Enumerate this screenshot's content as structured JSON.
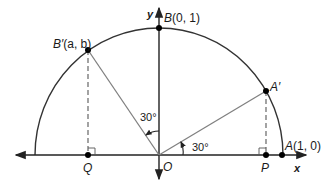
{
  "diagram": {
    "type": "unit semicircle with rotated points",
    "axes": {
      "x_label": "x",
      "y_label": "y"
    },
    "points": {
      "origin": {
        "label": "O"
      },
      "A": {
        "label": "A",
        "coords": "(1, 0)"
      },
      "A_prime": {
        "label": "A′"
      },
      "B": {
        "label": "B",
        "coords": "(0, 1)"
      },
      "B_prime": {
        "label": "B′",
        "coords": "(a, b)"
      },
      "P": {
        "label": "P"
      },
      "Q": {
        "label": "Q"
      }
    },
    "angles": {
      "angle_AOA_prime": "30°",
      "angle_BOB_prime": "30°"
    },
    "colors": {
      "stroke": "#333333",
      "radius_lines": "#808080",
      "dashed": "#666666",
      "point": "#000000"
    }
  }
}
